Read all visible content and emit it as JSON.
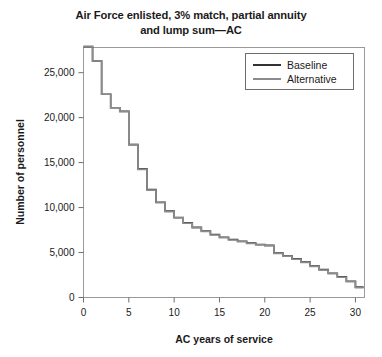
{
  "chart_data": {
    "type": "line",
    "title": "Air Force enlisted, 3% match, partial annuity and lump sum—AC",
    "title_line1": "Air Force enlisted, 3% match, partial annuity",
    "title_line2": "and lump sum—AC",
    "xlabel": "AC years of service",
    "ylabel": "Number of personnel",
    "xlim": [
      0,
      31
    ],
    "ylim": [
      0,
      27800
    ],
    "xticks": [
      0,
      5,
      10,
      15,
      20,
      25,
      30
    ],
    "xticklabels": [
      "0",
      "5",
      "10",
      "15",
      "20",
      "25",
      "30"
    ],
    "yticks": [
      0,
      5000,
      10000,
      15000,
      20000,
      25000
    ],
    "yticklabels": [
      "0",
      "5,000",
      "10,000",
      "15,000",
      "20,000",
      "25,000"
    ],
    "grid": false,
    "drawstyle": "steps-post",
    "legend_position": "upper right",
    "x": [
      0,
      1,
      2,
      3,
      4,
      5,
      6,
      7,
      8,
      9,
      10,
      11,
      12,
      13,
      14,
      15,
      16,
      17,
      18,
      19,
      20,
      21,
      22,
      23,
      24,
      25,
      26,
      27,
      28,
      29,
      30
    ],
    "series": [
      {
        "name": "Baseline",
        "color": "#333333",
        "values": [
          27900,
          26300,
          22600,
          21100,
          20700,
          17000,
          14300,
          12000,
          10600,
          9600,
          8900,
          8300,
          7800,
          7400,
          7000,
          6700,
          6450,
          6250,
          6050,
          5900,
          5800,
          4950,
          4650,
          4300,
          3950,
          3500,
          3100,
          2700,
          2300,
          1800,
          1150
        ]
      },
      {
        "name": "Alternative",
        "color": "#8c8c8c",
        "values": [
          27900,
          26300,
          22600,
          21100,
          20700,
          17000,
          14250,
          11950,
          10550,
          9550,
          8850,
          8250,
          7750,
          7350,
          6950,
          6650,
          6400,
          6200,
          6000,
          5850,
          5750,
          4900,
          4600,
          4250,
          3900,
          3450,
          3050,
          2650,
          2250,
          1750,
          1100
        ]
      }
    ]
  },
  "legend": {
    "items": [
      {
        "label": "Baseline"
      },
      {
        "label": "Alternative"
      }
    ]
  }
}
